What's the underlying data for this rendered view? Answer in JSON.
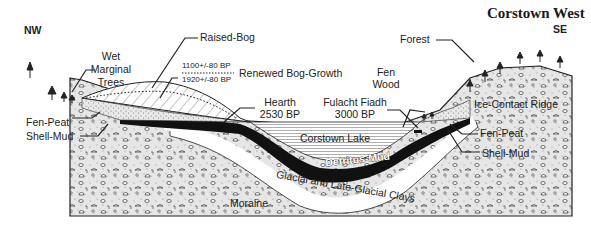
{
  "title": "Corstown West",
  "orientation": {
    "left": "NW",
    "right": "SE"
  },
  "labels": {
    "raised_bog": "Raised-Bog",
    "wet_marginal_trees": [
      "Wet",
      "Marginal",
      "Trees"
    ],
    "date_upper": "1100+/-80 BP",
    "date_lower": "1920+/-80 BP",
    "renewed_bog_growth": "Renewed Bog-Growth",
    "hearth": [
      "Hearth",
      "2530 BP"
    ],
    "fulacht_fiadh": [
      "Fulacht Fiadh",
      "3000 BP"
    ],
    "fen_wood": [
      "Fen",
      "Wood"
    ],
    "forest": "Forest",
    "ice_contact_ridge": "Ice-Contact Ridge",
    "fen_peat_left": "Fen-Peat",
    "shell_mud_left": "Shell-Mud",
    "fen_peat_right": "Fen-Peat",
    "shell_mud_right": "Shell-Mud",
    "corstown_lake": "Corstown Lake",
    "detritus_mud": "Detritus-Mud",
    "glacial_clays": "Glacial and Late-Glacial Clays",
    "moraine": "Moraine"
  },
  "colors": {
    "ink": "#1a1a1a",
    "paper": "#ffffff",
    "stipple": "#bdbdbd"
  }
}
